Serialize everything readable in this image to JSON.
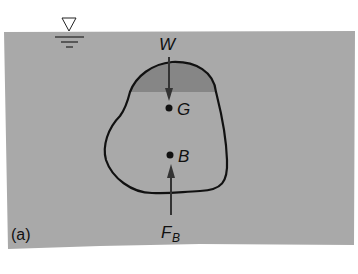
{
  "figure": {
    "caption_label": "(a)",
    "colors": {
      "water": "#a9a9a9",
      "displaced_region": "#8a8a8a",
      "outline": "#111111",
      "background": "#ffffff"
    },
    "labels": {
      "weight": "W",
      "center_of_gravity": "G",
      "center_of_buoyancy": "B",
      "buoyant_force": "F",
      "buoyant_force_subscript": "B"
    },
    "symbols": {
      "free_surface": "water-surface-triangle"
    }
  }
}
